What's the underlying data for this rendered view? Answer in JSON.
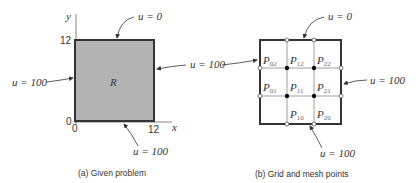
{
  "panel_a": {
    "caption": "(a)  Given problem",
    "region_label": "R",
    "axis_x_label": "x",
    "axis_y_label": "y",
    "ticks": {
      "y_top": "12",
      "origin_y": "0",
      "origin_x": "0",
      "x_right": "12"
    },
    "boundary_labels": {
      "top": "u = 0",
      "left": "u = 100",
      "right": "u = 100",
      "bottom": "u = 100"
    },
    "fill_color": "#b3b3b3",
    "border_color": "#333333"
  },
  "panel_b": {
    "caption": "(b)  Grid and mesh points",
    "boundary_labels": {
      "top": "u = 0",
      "right": "u = 100",
      "bottom": "u = 100"
    },
    "mesh_points": {
      "p02": "P",
      "p02_sub": "02",
      "p12": "P",
      "p12_sub": "12",
      "p22": "P",
      "p22_sub": "22",
      "p01": "P",
      "p01_sub": "01",
      "p11": "P",
      "p11_sub": "11",
      "p21": "P",
      "p21_sub": "21",
      "p10": "P",
      "p10_sub": "10",
      "p20": "P",
      "p20_sub": "20"
    }
  }
}
